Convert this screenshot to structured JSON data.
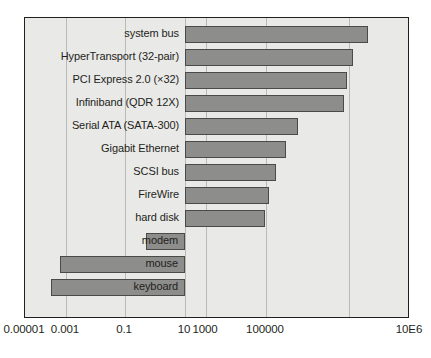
{
  "chart_data": {
    "type": "bar",
    "orientation": "horizontal",
    "title": "",
    "xlabel": "",
    "ylabel": "",
    "xscale": "log",
    "grid": true,
    "legend": false,
    "xtick_labels": [
      "0.00001",
      "0.001",
      "0.1",
      "10",
      "1000",
      "100000",
      "10E6"
    ],
    "xtick_values": [
      1e-05,
      0.001,
      0.1,
      10,
      1000,
      100000,
      1000000
    ],
    "xlim": [
      1e-05,
      10000000
    ],
    "baseline_value": 1,
    "categories": [
      "system bus",
      "HyperTransport (32-pair)",
      "PCI Express 2.0 (×32)",
      "Infiniband (QDR 12X)",
      "Serial ATA (SATA-300)",
      "Gigabit Ethernet",
      "SCSI bus",
      "FireWire",
      "hard disk",
      "modem",
      "mouse",
      "keyboard"
    ],
    "values": [
      400000,
      100000,
      80000,
      70000,
      300,
      125,
      80,
      50,
      40,
      0.007,
      7e-05,
      3e-05
    ],
    "bars": [
      {
        "label": "system bus",
        "value": 400000,
        "start_px": 184,
        "end_px": 367,
        "label_placement": "outside"
      },
      {
        "label": "HyperTransport (32-pair)",
        "value": 100000,
        "start_px": 184,
        "end_px": 352,
        "label_placement": "outside"
      },
      {
        "label": "PCI Express 2.0 (×32)",
        "value": 80000,
        "start_px": 184,
        "end_px": 346,
        "label_placement": "outside"
      },
      {
        "label": "Infiniband (QDR 12X)",
        "value": 70000,
        "start_px": 184,
        "end_px": 343,
        "label_placement": "outside"
      },
      {
        "label": "Serial ATA (SATA-300)",
        "value": 300,
        "start_px": 184,
        "end_px": 297,
        "label_placement": "outside"
      },
      {
        "label": "Gigabit Ethernet",
        "value": 125,
        "start_px": 184,
        "end_px": 285,
        "label_placement": "outside"
      },
      {
        "label": "SCSI bus",
        "value": 80,
        "start_px": 184,
        "end_px": 275,
        "label_placement": "outside"
      },
      {
        "label": "FireWire",
        "value": 50,
        "start_px": 184,
        "end_px": 268,
        "label_placement": "outside"
      },
      {
        "label": "hard disk",
        "value": 40,
        "start_px": 184,
        "end_px": 264,
        "label_placement": "outside"
      },
      {
        "label": "modem",
        "value": 0.007,
        "start_px": 145,
        "end_px": 184,
        "label_placement": "inside"
      },
      {
        "label": "mouse",
        "value": 7e-05,
        "start_px": 59,
        "end_px": 184,
        "label_placement": "inside"
      },
      {
        "label": "keyboard",
        "value": 3e-05,
        "start_px": 50,
        "end_px": 184,
        "label_placement": "inside"
      }
    ],
    "gridline_px": [
      65,
      124,
      184,
      205,
      265,
      348
    ],
    "colors": {
      "bar_fill": "#8d8d8b",
      "bar_stroke": "#4a4a48",
      "plot_background": "#e9e9e7",
      "frame": "#231f20",
      "gridline": "#b9b9b6",
      "text": "#231f20"
    },
    "geometry": {
      "plot_left_px": 24,
      "plot_top_px": 17,
      "plot_width_px": 385,
      "plot_height_px": 301,
      "row_pitch_px": 23,
      "bar_height_px": 17,
      "first_row_top_px": 5
    }
  }
}
